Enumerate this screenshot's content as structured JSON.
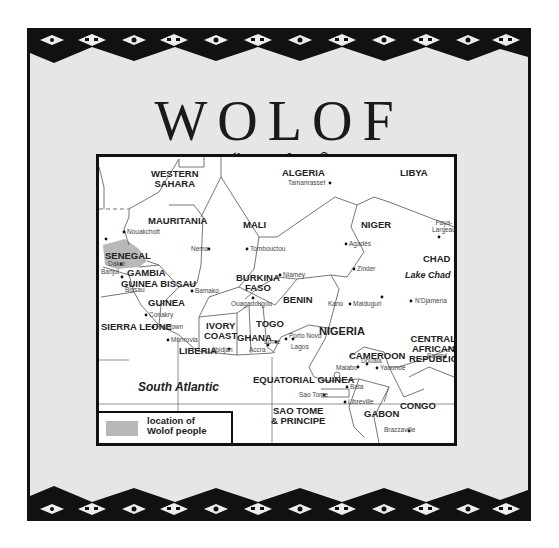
{
  "title": "WOLOF",
  "pronunciation": "('waw lawf)",
  "legend": {
    "label": "location of Wolof people",
    "line1": "location of",
    "line2": "Wolof people",
    "swatch_color": "#b8b8b8"
  },
  "colors": {
    "frame_background": "#e6e6e6",
    "border": "#111111",
    "map_background": "#ffffff",
    "highlight": "#b8b8b8"
  },
  "map": {
    "ocean_label": "South Atlantic",
    "lake_label": "Lake Chad",
    "countries": {
      "western_sahara": "WESTERN SAHARA",
      "western_sahara_l1": "WESTERN",
      "western_sahara_l2": "SAHARA",
      "algeria": "ALGERIA",
      "libya": "LIBYA",
      "mauritania": "MAURITANIA",
      "mali": "MALI",
      "niger": "NIGER",
      "chad": "CHAD",
      "senegal": "SENEGAL",
      "gambia": "GAMBIA",
      "guinea_bissau": "GUINEA BISSAU",
      "guinea": "GUINEA",
      "sierra_leone": "SIERRA LEONE",
      "liberia": "LIBERIA",
      "ivory_coast": "IVORY COAST",
      "ivory_coast_l1": "IVORY",
      "ivory_coast_l2": "COAST",
      "burkina_faso": "BURKINA FASO",
      "burkina_faso_l1": "BURKINA",
      "burkina_faso_l2": "FASO",
      "ghana": "GHANA",
      "togo": "TOGO",
      "benin": "BENIN",
      "nigeria": "NIGERIA",
      "cameroon": "CAMEROON",
      "car": "CENTRAL AFRICAN REPUBLIC",
      "car_l1": "CENTRAL",
      "car_l2": "AFRICAN",
      "car_l3": "REPUBLIC",
      "equatorial_guinea": "EQUATORIAL GUINEA",
      "sao_tome": "SAO TOME & PRINCIPE",
      "sao_tome_l1": "SAO TOME",
      "sao_tome_l2": "& PRINCIPE",
      "gabon": "GABON",
      "congo": "CONGO"
    },
    "cities": {
      "tamanrasset": "Tamanrasset",
      "nouakchott": "Nouakchott",
      "nema": "Nema",
      "tombouctou": "Tombouctou",
      "agades": "Agadès",
      "faya": "Faya-",
      "largeau": "Largeau",
      "dakar": "Dakar",
      "banjul": "Banjul",
      "bissau": "Bissau",
      "bamako": "Bamako",
      "niamey": "Niamey",
      "zinder": "Zinder",
      "kano": "Kano",
      "maiduguri": "Maiduguri",
      "ndjamena": "N'Djamena",
      "ouagadougou": "Ouagadougou",
      "conakry": "Conakry",
      "freetown": "Freetown",
      "monrovia": "Monrovia",
      "abidjan": "Abidjan",
      "accra": "Accra",
      "lome": "Lome",
      "porto_novo": "Porto Novo",
      "lagos": "Lagos",
      "malabo": "Malabo",
      "douala": "Douala",
      "yaounde": "Yaoundé",
      "bangui": "Bangui",
      "bata": "Bata",
      "sao_tome": "Sao Tome",
      "libreville": "Libreville",
      "brazzaville": "Brazzaville"
    }
  }
}
